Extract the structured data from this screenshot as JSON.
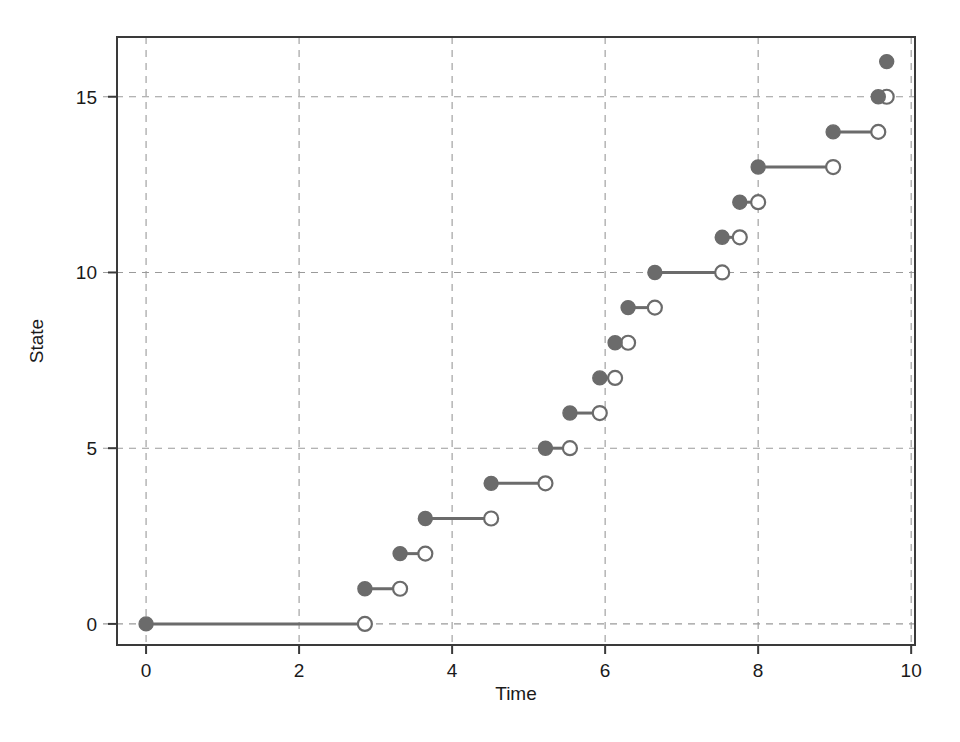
{
  "chart_data": {
    "type": "line",
    "plot_style": "step-function / counting process (right-continuous jumps)",
    "title": "",
    "subtitle": "",
    "xlabel": "Time",
    "ylabel": "State",
    "xlim": [
      -0.38,
      10.05
    ],
    "ylim": [
      -0.6,
      16.7
    ],
    "xticks": [
      0,
      2,
      4,
      6,
      8,
      10
    ],
    "xticklabels": [
      "0",
      "2",
      "4",
      "6",
      "8",
      "10"
    ],
    "yticks": [
      0,
      5,
      10,
      15
    ],
    "yticklabels": [
      "0",
      "5",
      "10",
      "15"
    ],
    "grid": true,
    "grid_style": "dashed",
    "grid_color": "#9a9a9a",
    "legend": null,
    "legend_position": "none",
    "frame": true,
    "series_color": "#6b6b6b",
    "marker_closed": "filled-circle",
    "marker_open": "open-circle",
    "annotations": [],
    "segments": [
      {
        "state": 0,
        "t_start": 0.0,
        "t_end": 2.86,
        "closed_left": true,
        "open_right": true
      },
      {
        "state": 1,
        "t_start": 2.86,
        "t_end": 3.32,
        "closed_left": true,
        "open_right": true
      },
      {
        "state": 2,
        "t_start": 3.32,
        "t_end": 3.65,
        "closed_left": true,
        "open_right": true
      },
      {
        "state": 3,
        "t_start": 3.65,
        "t_end": 4.51,
        "closed_left": true,
        "open_right": true
      },
      {
        "state": 4,
        "t_start": 4.51,
        "t_end": 5.22,
        "closed_left": true,
        "open_right": true
      },
      {
        "state": 5,
        "t_start": 5.22,
        "t_end": 5.54,
        "closed_left": true,
        "open_right": true
      },
      {
        "state": 6,
        "t_start": 5.54,
        "t_end": 5.93,
        "closed_left": true,
        "open_right": true
      },
      {
        "state": 7,
        "t_start": 5.93,
        "t_end": 6.13,
        "closed_left": true,
        "open_right": true
      },
      {
        "state": 8,
        "t_start": 6.13,
        "t_end": 6.3,
        "closed_left": true,
        "open_right": true
      },
      {
        "state": 9,
        "t_start": 6.3,
        "t_end": 6.65,
        "closed_left": true,
        "open_right": true
      },
      {
        "state": 10,
        "t_start": 6.65,
        "t_end": 7.53,
        "closed_left": true,
        "open_right": true
      },
      {
        "state": 11,
        "t_start": 7.53,
        "t_end": 7.76,
        "closed_left": true,
        "open_right": true
      },
      {
        "state": 12,
        "t_start": 7.76,
        "t_end": 8.0,
        "closed_left": true,
        "open_right": true
      },
      {
        "state": 13,
        "t_start": 8.0,
        "t_end": 8.98,
        "closed_left": true,
        "open_right": true
      },
      {
        "state": 14,
        "t_start": 8.98,
        "t_end": 9.57,
        "closed_left": true,
        "open_right": true
      },
      {
        "state": 15,
        "t_start": 9.57,
        "t_end": 9.68,
        "closed_left": true,
        "open_right": true
      },
      {
        "state": 16,
        "t_start": 9.68,
        "t_end": 9.68,
        "closed_left": true,
        "open_right": false
      }
    ],
    "jump_times": [
      2.86,
      3.32,
      3.65,
      4.51,
      5.22,
      5.54,
      5.93,
      6.13,
      6.3,
      6.65,
      7.53,
      7.76,
      8.0,
      8.98,
      9.57,
      9.68
    ],
    "states": [
      0,
      1,
      2,
      3,
      4,
      5,
      6,
      7,
      8,
      9,
      10,
      11,
      12,
      13,
      14,
      15,
      16
    ],
    "n_jumps": 16
  }
}
